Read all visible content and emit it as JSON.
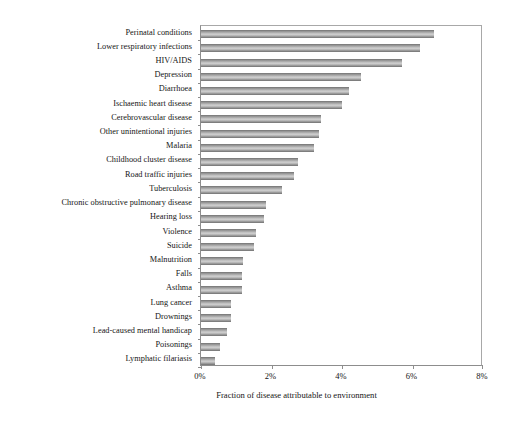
{
  "chart_data": {
    "type": "bar",
    "orientation": "horizontal",
    "title": "",
    "xlabel": "Fraction of disease attributable to environment",
    "ylabel": "",
    "xlim": [
      0,
      8
    ],
    "xticks": [
      0,
      2,
      4,
      6,
      8
    ],
    "xtick_labels": [
      "0%",
      "2%",
      "4%",
      "6%",
      "8%"
    ],
    "grid": false,
    "legend": false,
    "bar_color": "#c0c0c0",
    "categories": [
      "Perinatal conditions",
      "Lower respiratory infections",
      "HIV/AIDS",
      "Depression",
      "Diarrhoea",
      "Ischaemic heart disease",
      "Cerebrovascular disease",
      "Other unintentional injuries",
      "Malaria",
      "Childhood cluster disease",
      "Road traffic injuries",
      "Tuberculosis",
      "Chronic obstructive pulmonary disease",
      "Hearing loss",
      "Violence",
      "Suicide",
      "Malnutrition",
      "Falls",
      "Asthma",
      "Lung cancer",
      "Drownings",
      "Lead-caused mental handicap",
      "Poisonings",
      "Lymphatic filariasis"
    ],
    "values": [
      6.6,
      6.2,
      5.7,
      4.55,
      4.2,
      4.0,
      3.4,
      3.35,
      3.2,
      2.75,
      2.65,
      2.3,
      1.85,
      1.8,
      1.55,
      1.5,
      1.2,
      1.15,
      1.15,
      0.85,
      0.85,
      0.75,
      0.55,
      0.4
    ],
    "value_unit": "%"
  }
}
